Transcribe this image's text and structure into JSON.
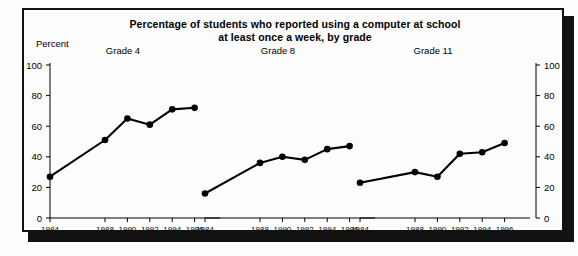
{
  "figure": {
    "title_line1": "Percentage of students who reported using a computer at school",
    "title_line2": "at least once a week, by grade",
    "y_axis_label": "Percent"
  },
  "chart_data": {
    "type": "line",
    "title": "Percentage of students who reported using a computer at school at least once a week, by grade",
    "xlabel": "",
    "ylabel": "Percent",
    "ylim": [
      0,
      100
    ],
    "yticks": [
      0,
      20,
      40,
      60,
      80,
      100
    ],
    "grid": false,
    "legend": "none",
    "dual_y_axis": true,
    "panels": [
      {
        "name": "Grade 4",
        "x": [
          "1984",
          "1988",
          "1990",
          "1992",
          "1994",
          "1996"
        ],
        "values": [
          27,
          51,
          65,
          61,
          71,
          72
        ]
      },
      {
        "name": "Grade 8",
        "x": [
          "1984",
          "1988",
          "1990",
          "1992",
          "1994",
          "1996"
        ],
        "values": [
          16,
          36,
          40,
          38,
          45,
          47
        ]
      },
      {
        "name": "Grade 11",
        "x": [
          "1984",
          "1988",
          "1990",
          "1992",
          "1994",
          "1996"
        ],
        "values": [
          23,
          30,
          27,
          42,
          43,
          49
        ]
      }
    ]
  }
}
